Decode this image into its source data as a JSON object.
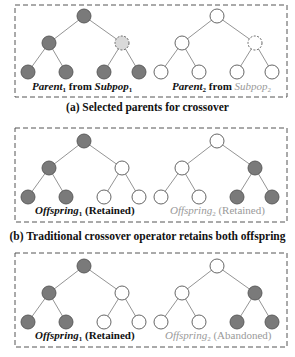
{
  "colors": {
    "filled": "#7a7a7a",
    "light_filled": "#d9d9d9",
    "empty": "#ffffff",
    "stroke": "#555555",
    "edge": "#888888",
    "box_border": "#555555",
    "gray_text": "#9a9a9a",
    "black_text": "#111111"
  },
  "panels": [
    {
      "id": "a",
      "caption": "(a) Selected parents for crossover",
      "trees": [
        {
          "label_main": "Parent",
          "label_sub": "1",
          "label_mid": " from ",
          "label_pop": "Subpop",
          "label_pop_sub": "1",
          "color": "black",
          "nodes": [
            "filled",
            "filled",
            "light-dashed",
            "filled",
            "filled",
            "filled",
            "filled"
          ]
        },
        {
          "label_main": "Parent",
          "label_sub": "2",
          "label_mid": " from ",
          "label_pop": "Subpop",
          "label_pop_sub": "2",
          "color": "mixed",
          "nodes": [
            "empty",
            "empty",
            "empty-dashed",
            "empty",
            "empty",
            "empty",
            "empty"
          ]
        }
      ]
    },
    {
      "id": "b",
      "caption": "(b) Traditional crossover operator retains both offspring",
      "trees": [
        {
          "label_main": "Offspring",
          "label_sub": "1",
          "label_status": " (Retained)",
          "color": "black",
          "nodes": [
            "filled",
            "filled",
            "empty",
            "filled",
            "filled",
            "empty",
            "empty"
          ]
        },
        {
          "label_main": "Offspring",
          "label_sub": "2",
          "label_status": " (Retained)",
          "color": "gray",
          "nodes": [
            "empty",
            "empty",
            "filled",
            "empty",
            "empty",
            "filled",
            "filled"
          ]
        }
      ]
    },
    {
      "id": "c",
      "caption": "",
      "trees": [
        {
          "label_main": "Offspring",
          "label_sub": "1",
          "label_status": " (Retained)",
          "color": "black",
          "nodes": [
            "filled",
            "filled",
            "empty",
            "filled",
            "filled",
            "empty",
            "empty"
          ]
        },
        {
          "label_main": "Offspring",
          "label_sub": "2",
          "label_status": " (Abandoned)",
          "color": "gray",
          "nodes": [
            "empty",
            "empty",
            "filled",
            "empty",
            "empty",
            "filled",
            "filled"
          ]
        }
      ]
    }
  ]
}
